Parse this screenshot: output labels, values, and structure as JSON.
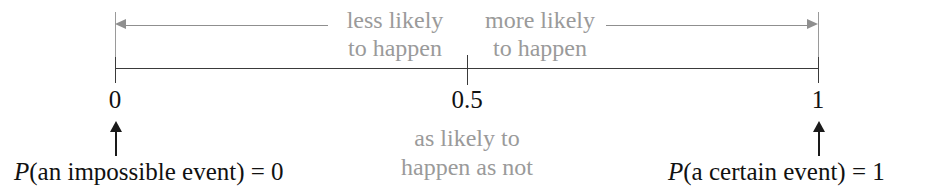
{
  "figure": {
    "colors": {
      "axis": "#3a3a3a",
      "grey_text": "#9a9a9a",
      "grey_rule": "#8f8f8f",
      "black_text": "#111111",
      "background": "#ffffff"
    }
  },
  "axis": {
    "min_label": "0",
    "mid_label": "0.5",
    "max_label": "1",
    "range": [
      0,
      1
    ]
  },
  "annotations": {
    "less_likely": "less likely\nto happen",
    "less_likely_line1": "less likely",
    "less_likely_line2": "to happen",
    "more_likely_line1": "more likely",
    "more_likely_line2": "to happen",
    "as_likely_line1": "as likely to",
    "as_likely_line2": "happen as not",
    "impossible_p": "P",
    "impossible_rest": "(an impossible event) = 0",
    "certain_p": "P",
    "certain_rest": "(a certain event) = 1"
  },
  "chart_data": {
    "type": "line",
    "xlabel": "",
    "ylabel": "",
    "xlim": [
      0,
      1
    ],
    "grid": false,
    "legend": null,
    "x_ticks": [
      0,
      0.5,
      1
    ],
    "x_tick_labels": [
      "0",
      "0.5",
      "1"
    ],
    "regions": [
      {
        "name": "less likely to happen",
        "from": 0,
        "to": 0.5,
        "label": "less likely to happen",
        "arrow_direction": "left"
      },
      {
        "name": "more likely to happen",
        "from": 0.5,
        "to": 1,
        "label": "more likely to happen",
        "arrow_direction": "right"
      }
    ],
    "point_annotations": [
      {
        "x": 0,
        "label": "P(an impossible event) = 0"
      },
      {
        "x": 0.5,
        "label": "as likely to happen as not"
      },
      {
        "x": 1,
        "label": "P(a certain event) = 1"
      }
    ]
  }
}
